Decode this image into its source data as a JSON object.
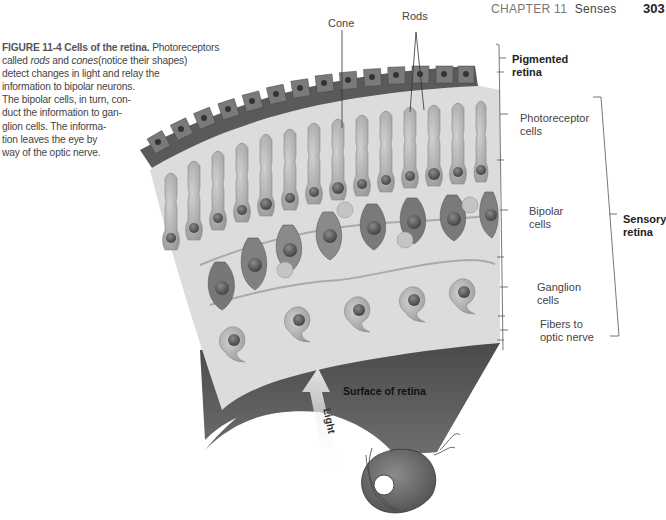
{
  "header": {
    "chapter": "CHAPTER 11",
    "section": "Senses",
    "page_number": "303"
  },
  "caption": {
    "figure_label": "FIGURE 11-4",
    "title": "Cells of the retina.",
    "lines": [
      "Photoreceptors",
      "called",
      "rods",
      "and",
      "cones",
      "(notice their shapes)",
      "detect changes in light and relay the",
      "information to bipolar neurons.",
      "The bipolar cells, in turn, con-",
      "duct the information to gan-",
      "glion cells. The informa-",
      "tion leaves the eye by",
      "way of the optic nerve."
    ]
  },
  "figure": {
    "top_labels": {
      "cone": "Cone",
      "rods": "Rods"
    },
    "layer_labels": [
      {
        "id": "pigmented",
        "line1": "Pigmented",
        "line2": "retina",
        "bold": true
      },
      {
        "id": "photoreceptor",
        "line1": "Photoreceptor",
        "line2": "cells",
        "bold": false
      },
      {
        "id": "bipolar",
        "line1": "Bipolar",
        "line2": "cells",
        "bold": false
      },
      {
        "id": "ganglion",
        "line1": "Ganglion",
        "line2": "cells",
        "bold": false
      },
      {
        "id": "fibers",
        "line1": "Fibers to",
        "line2": "optic nerve",
        "bold": false
      }
    ],
    "group_label": {
      "line1": "Sensory",
      "line2": "retina"
    },
    "surface_label": "Surface of retina",
    "arrow_label": "Light",
    "colors": {
      "pigment_layer": "#5a5a5a",
      "retina_bg": "#d9d9d9",
      "surface": "#5e5e5e",
      "cell_fill": "#bdbdbd",
      "nucleus": "#6a6a6a",
      "arrow": "#e6e6e6"
    }
  }
}
